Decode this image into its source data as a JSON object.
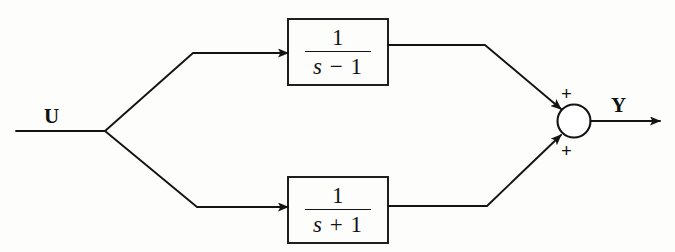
{
  "diagram": {
    "type": "block-diagram",
    "input": {
      "label": "U",
      "name": "input-signal"
    },
    "output": {
      "label": "Y",
      "name": "output-signal"
    },
    "blocks": [
      {
        "id": "top-block",
        "transfer_function": "1/(s - 1)",
        "numerator": "1",
        "denominator_var": "s",
        "denominator_op": "−",
        "denominator_const": "1",
        "position": "upper-branch"
      },
      {
        "id": "bottom-block",
        "transfer_function": "1/(s + 1)",
        "numerator": "1",
        "denominator_var": "s",
        "denominator_op": "+",
        "denominator_const": "1",
        "position": "lower-branch"
      }
    ],
    "summing_junction": {
      "name": "summing-junction",
      "shape": "circle",
      "signs": [
        {
          "id": "top-sign",
          "symbol": "+"
        },
        {
          "id": "bottom-sign",
          "symbol": "+"
        }
      ]
    },
    "colors": {
      "line": "#141414",
      "text": "#101010",
      "background": "#fdfdfc"
    }
  }
}
